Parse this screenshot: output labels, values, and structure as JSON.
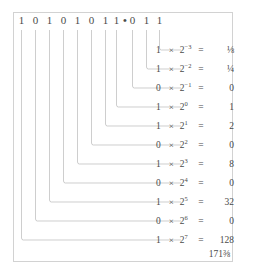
{
  "figure": {
    "numeral": {
      "digits": [
        "1",
        "0",
        "1",
        "0",
        "1",
        "0",
        "1",
        "1",
        "0",
        "1",
        "1"
      ],
      "radix_point": "•",
      "radix_after_index": 7,
      "value_text": "10101011.011"
    },
    "rows": [
      {
        "bit": "1",
        "times": "×",
        "base": "2",
        "exponent": "−3",
        "equals": "=",
        "value": "⅛"
      },
      {
        "bit": "1",
        "times": "×",
        "base": "2",
        "exponent": "−2",
        "equals": "=",
        "value": "¼"
      },
      {
        "bit": "0",
        "times": "×",
        "base": "2",
        "exponent": "−1",
        "equals": "=",
        "value": "0"
      },
      {
        "bit": "1",
        "times": "×",
        "base": "2",
        "exponent": "0",
        "equals": "=",
        "value": "1"
      },
      {
        "bit": "1",
        "times": "×",
        "base": "2",
        "exponent": "1",
        "equals": "=",
        "value": "2"
      },
      {
        "bit": "0",
        "times": "×",
        "base": "2",
        "exponent": "2",
        "equals": "=",
        "value": "0"
      },
      {
        "bit": "1",
        "times": "×",
        "base": "2",
        "exponent": "3",
        "equals": "=",
        "value": "8"
      },
      {
        "bit": "0",
        "times": "×",
        "base": "2",
        "exponent": "4",
        "equals": "=",
        "value": "0"
      },
      {
        "bit": "1",
        "times": "×",
        "base": "2",
        "exponent": "5",
        "equals": "=",
        "value": "32"
      },
      {
        "bit": "0",
        "times": "×",
        "base": "2",
        "exponent": "6",
        "equals": "=",
        "value": "0"
      },
      {
        "bit": "1",
        "times": "×",
        "base": "2",
        "exponent": "7",
        "equals": "=",
        "value": "128"
      }
    ],
    "total": "171⅜",
    "colors": {
      "text": "#4a4a4a",
      "rule": "#b9b9b9",
      "frame": "#d2d2d2",
      "background": "#ffffff"
    }
  }
}
